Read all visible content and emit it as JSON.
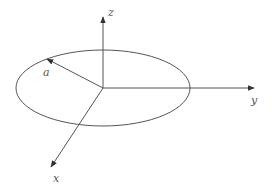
{
  "diagram": {
    "type": "3d-coordinate-system-with-circle",
    "colors": {
      "line": "#555555",
      "background": "#ffffff"
    },
    "origin": {
      "x": 103,
      "y": 88
    },
    "ellipse": {
      "cx": 103,
      "cy": 88,
      "rx": 87,
      "ry": 38
    },
    "axes": {
      "z": {
        "label": "z"
      },
      "y": {
        "label": "y"
      },
      "x": {
        "label": "x"
      }
    },
    "radius": {
      "label": "a"
    }
  }
}
